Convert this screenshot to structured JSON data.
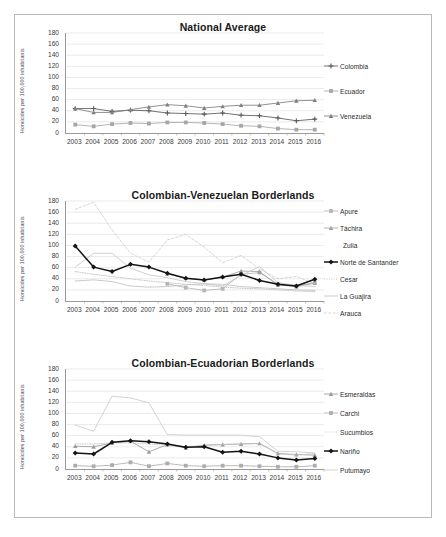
{
  "figure": {
    "ylabel": "Homicides per 100,000 inhabitants",
    "years": [
      "2003",
      "2004",
      "2005",
      "2006",
      "2007",
      "2008",
      "2009",
      "2010",
      "2011",
      "2012",
      "2013",
      "2014",
      "2015",
      "2016"
    ],
    "yticks": [
      "180",
      "160",
      "140",
      "120",
      "100",
      "80",
      "60",
      "40",
      "20",
      "0"
    ]
  },
  "chart_data": [
    {
      "type": "line",
      "title": "National Average",
      "xlabel": "",
      "ylabel": "Homicides per 100,000 inhabitants",
      "ylim": [
        0,
        180
      ],
      "ytick_step": 20,
      "grid": true,
      "legend_position": "right",
      "x": [
        "2003",
        "2004",
        "2005",
        "2006",
        "2007",
        "2008",
        "2009",
        "2010",
        "2011",
        "2012",
        "2013",
        "2014",
        "2015",
        "2016"
      ],
      "series": [
        {
          "name": "Colombia",
          "color": "#595959",
          "marker": "plus",
          "style": "solid",
          "values": [
            44,
            44,
            39,
            41,
            40,
            36,
            35,
            34,
            36,
            32,
            31,
            27,
            22,
            25
          ]
        },
        {
          "name": "Ecuador",
          "color": "#a6a6a6",
          "marker": "square",
          "style": "solid",
          "values": [
            15,
            12,
            16,
            18,
            17,
            19,
            19,
            18,
            16,
            13,
            12,
            8,
            6,
            6
          ]
        },
        {
          "name": "Venezuela",
          "color": "#808080",
          "marker": "triangle",
          "style": "solid",
          "values": [
            44,
            37,
            37,
            42,
            47,
            51,
            49,
            45,
            48,
            50,
            50,
            54,
            58,
            59
          ]
        }
      ]
    },
    {
      "type": "line",
      "title": "Colombian-Venezuelan Borderlands",
      "xlabel": "",
      "ylabel": "Homicides per 100,000 inhabitants",
      "ylim": [
        0,
        180
      ],
      "ytick_step": 20,
      "grid": true,
      "legend_position": "right",
      "x": [
        "2003",
        "2004",
        "2005",
        "2006",
        "2007",
        "2008",
        "2009",
        "2010",
        "2011",
        "2012",
        "2013",
        "2014",
        "2015",
        "2016"
      ],
      "series": [
        {
          "name": "Apure",
          "color": "#b5b5b5",
          "marker": "square",
          "style": "solid",
          "values": [
            null,
            null,
            null,
            null,
            null,
            31,
            24,
            19,
            22,
            48,
            51,
            30,
            27,
            33
          ]
        },
        {
          "name": "Táchira",
          "color": "#a0a0a0",
          "marker": "triangle",
          "style": "solid",
          "values": [
            null,
            null,
            null,
            null,
            null,
            49,
            41,
            38,
            43,
            54,
            53,
            29,
            26,
            32
          ]
        },
        {
          "name": "Zulia",
          "color": "#c8c8c8",
          "marker": "none",
          "style": "solid",
          "values": [
            61,
            86,
            86,
            59,
            47,
            42,
            35,
            31,
            27,
            46,
            62,
            33,
            28,
            26
          ]
        },
        {
          "name": "Norte de Santander",
          "color": "#141414",
          "marker": "diamond",
          "style": "solid",
          "values": [
            99,
            61,
            53,
            66,
            61,
            50,
            41,
            38,
            43,
            48,
            37,
            30,
            27,
            39
          ]
        },
        {
          "name": "Cesar",
          "color": "#bdbdbd",
          "marker": "none",
          "style": "dotted",
          "values": [
            53,
            48,
            44,
            40,
            36,
            33,
            30,
            28,
            25,
            23,
            22,
            20,
            18,
            17
          ]
        },
        {
          "name": "La Guajira",
          "color": "#c0c0c0",
          "marker": "none",
          "style": "solid",
          "values": [
            36,
            38,
            35,
            27,
            25,
            26,
            29,
            31,
            30,
            26,
            24,
            22,
            20,
            19
          ]
        },
        {
          "name": "Arauca",
          "color": "#cfcfcf",
          "marker": "none",
          "style": "dashed",
          "values": [
            165,
            178,
            128,
            86,
            70,
            110,
            120,
            97,
            69,
            82,
            58,
            40,
            44,
            31
          ]
        }
      ]
    },
    {
      "type": "line",
      "title": "Colombian-Ecuadorian Borderlands",
      "xlabel": "",
      "ylabel": "Homicides per 100,000 inhabitants",
      "ylim": [
        0,
        180
      ],
      "ytick_step": 20,
      "grid": true,
      "legend_position": "right",
      "x": [
        "2003",
        "2004",
        "2005",
        "2006",
        "2007",
        "2008",
        "2009",
        "2010",
        "2011",
        "2012",
        "2013",
        "2014",
        "2015",
        "2016"
      ],
      "series": [
        {
          "name": "Esmeraldas",
          "color": "#9c9c9c",
          "marker": "triangle",
          "style": "solid",
          "values": [
            41,
            40,
            47,
            50,
            31,
            44,
            38,
            43,
            44,
            45,
            46,
            28,
            26,
            25
          ]
        },
        {
          "name": "Carchi",
          "color": "#adadad",
          "marker": "square",
          "style": "solid",
          "values": [
            6,
            5,
            7,
            12,
            5,
            10,
            6,
            5,
            6,
            6,
            5,
            4,
            4,
            6
          ]
        },
        {
          "name": "Sucumbios",
          "color": "#c4c4c4",
          "marker": "none",
          "style": "dotted",
          "values": [
            45,
            45,
            47,
            47,
            45,
            43,
            40,
            42,
            44,
            45,
            46,
            27,
            25,
            28
          ]
        },
        {
          "name": "Nariño",
          "color": "#141414",
          "marker": "diamond",
          "style": "solid",
          "values": [
            29,
            27,
            48,
            51,
            49,
            45,
            39,
            40,
            30,
            32,
            27,
            20,
            16,
            19
          ]
        },
        {
          "name": "Putumayo",
          "color": "#cbcbcb",
          "marker": "none",
          "style": "solid",
          "values": [
            79,
            68,
            131,
            128,
            119,
            62,
            61,
            61,
            61,
            61,
            58,
            32,
            31,
            29
          ]
        }
      ]
    }
  ],
  "legends": [
    {
      "items": [
        {
          "label": "Colombia",
          "key": "line-marker-plus"
        },
        {
          "label": "Ecuador",
          "key": "line-marker-square"
        },
        {
          "label": "Venezuela",
          "key": "line-marker-triangle"
        }
      ]
    },
    {
      "items": [
        {
          "label": "Apure",
          "key": "line-marker-square"
        },
        {
          "label": "Táchira",
          "key": "line-marker-triangle"
        },
        {
          "label": "Zulia",
          "key": "line-plain"
        },
        {
          "label": "Norte de Santander",
          "key": "line-marker-diamond"
        },
        {
          "label": "Cesar",
          "key": "line-dotted"
        },
        {
          "label": "La Guajira",
          "key": "line-plain"
        },
        {
          "label": "Arauca",
          "key": "line-dashed"
        }
      ]
    },
    {
      "items": [
        {
          "label": "Esmeraldas",
          "key": "line-marker-triangle"
        },
        {
          "label": "Carchi",
          "key": "line-marker-square"
        },
        {
          "label": "Sucumbios",
          "key": "line-dotted"
        },
        {
          "label": "Nariño",
          "key": "line-marker-diamond"
        },
        {
          "label": "Putumayo",
          "key": "line-plain"
        }
      ]
    }
  ]
}
